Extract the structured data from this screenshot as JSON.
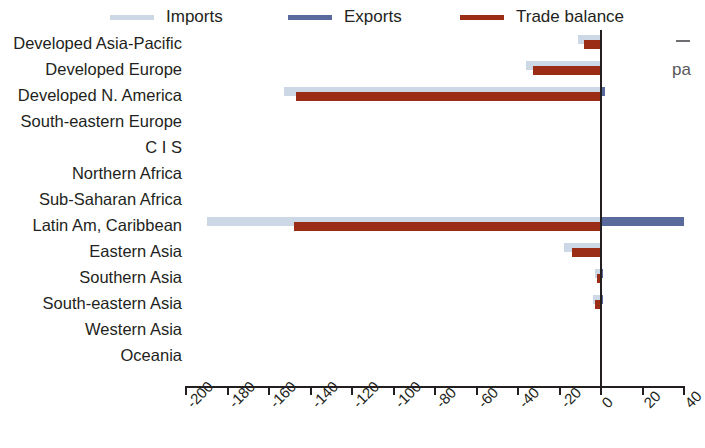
{
  "legend": {
    "items": [
      {
        "label": "Imports",
        "color": "#cdd8e6",
        "name": "legend-imports"
      },
      {
        "label": "Exports",
        "color": "#5b6a9c",
        "name": "legend-exports"
      },
      {
        "label": "Trade balance",
        "color": "#9b2d16",
        "name": "legend-balance"
      }
    ]
  },
  "edge_annotation": {
    "text": "pa",
    "tick": ""
  },
  "chart_data": {
    "type": "bar",
    "orientation": "horizontal",
    "title": "",
    "xlabel": "",
    "ylabel": "",
    "xlim": [
      -200,
      40
    ],
    "xticks": [
      -200,
      -180,
      -160,
      -140,
      -120,
      -100,
      -80,
      -60,
      -40,
      -20,
      0,
      20,
      40
    ],
    "xtick_labels": [
      "-200",
      "-180",
      "-160",
      "-140",
      "-120",
      "-100",
      "-80",
      "-60",
      "-40",
      "-20",
      "0",
      "20",
      "40"
    ],
    "grid": false,
    "legend_position": "top",
    "zero_line": 0,
    "categories": [
      "Developed Asia-Pacific",
      "Developed Europe",
      "Developed N. America",
      "South-eastern Europe",
      "C I S",
      "Northern Africa",
      "Sub-Saharan Africa",
      "Latin Am, Caribbean",
      "Eastern Asia",
      "Southern Asia",
      "South-eastern Asia",
      "Western Asia",
      "Oceania"
    ],
    "series": [
      {
        "name": "Imports",
        "color": "#cdd8e6",
        "values": [
          -11,
          -36,
          -153,
          0,
          0,
          0,
          0,
          -190,
          -18,
          -3,
          -4,
          0,
          0
        ]
      },
      {
        "name": "Exports",
        "color": "#5b6a9c",
        "values": [
          0,
          0,
          2,
          0,
          0,
          0,
          0,
          40,
          0,
          1,
          1,
          0,
          0
        ]
      },
      {
        "name": "Trade balance",
        "color": "#9b2d16",
        "values": [
          -8,
          -33,
          -147,
          0,
          0,
          0,
          0,
          -148,
          -14,
          -2,
          -3,
          0,
          0
        ]
      }
    ]
  }
}
